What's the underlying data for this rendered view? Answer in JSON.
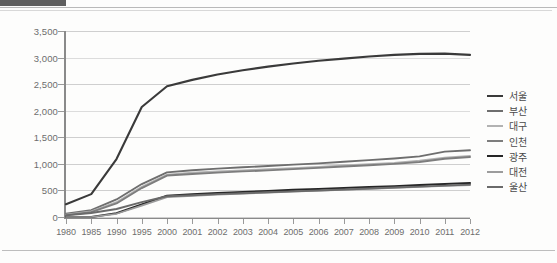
{
  "chart_data": {
    "type": "line",
    "title": "",
    "xlabel": "",
    "ylabel": "",
    "ylim": [
      0,
      3500
    ],
    "ytick_step": 500,
    "grid": true,
    "legend_position": "right",
    "categories": [
      "1980",
      "1985",
      "1990",
      "1995",
      "2000",
      "2001",
      "2002",
      "2003",
      "2004",
      "2005",
      "2006",
      "2007",
      "2008",
      "2009",
      "2010",
      "2011",
      "2012"
    ],
    "ytick_labels": [
      "0",
      "500",
      "1,000",
      "1,500",
      "2,000",
      "2,500",
      "3,000",
      "3,500"
    ],
    "ytick_values": [
      0,
      500,
      1000,
      1500,
      2000,
      2500,
      3000,
      3500
    ],
    "series": [
      {
        "name": "서울",
        "color": "#3a3a3a",
        "width": 2.1,
        "values": [
          240,
          430,
          1090,
          2070,
          2460,
          2580,
          2680,
          2760,
          2830,
          2890,
          2940,
          2980,
          3020,
          3050,
          3070,
          3075,
          3050
        ]
      },
      {
        "name": "부산",
        "color": "#6e6e6e",
        "width": 1.9,
        "values": [
          60,
          130,
          330,
          620,
          840,
          880,
          910,
          935,
          960,
          985,
          1010,
          1040,
          1070,
          1100,
          1140,
          1230,
          1255
        ]
      },
      {
        "name": "대구",
        "color": "#b2b2b2",
        "width": 1.7,
        "values": [
          45,
          105,
          280,
          570,
          800,
          835,
          860,
          880,
          900,
          920,
          945,
          970,
          995,
          1020,
          1060,
          1120,
          1150
        ]
      },
      {
        "name": "인천",
        "color": "#7d7d7d",
        "width": 1.9,
        "values": [
          35,
          90,
          255,
          545,
          780,
          810,
          835,
          858,
          878,
          900,
          925,
          950,
          975,
          1000,
          1035,
          1095,
          1130
        ]
      },
      {
        "name": "광주",
        "color": "#262626",
        "width": 2.1,
        "values": [
          0,
          0,
          70,
          235,
          400,
          425,
          450,
          470,
          490,
          510,
          528,
          545,
          562,
          580,
          600,
          620,
          640
        ]
      },
      {
        "name": "대전",
        "color": "#9c9c9c",
        "width": 1.7,
        "values": [
          0,
          0,
          60,
          215,
          375,
          398,
          420,
          440,
          458,
          476,
          494,
          512,
          530,
          548,
          566,
          584,
          600
        ]
      },
      {
        "name": "울산",
        "color": "#6a6a6a",
        "width": 1.9,
        "values": [
          30,
          75,
          150,
          280,
          390,
          410,
          430,
          448,
          465,
          482,
          500,
          518,
          536,
          554,
          572,
          590,
          610
        ]
      }
    ]
  }
}
